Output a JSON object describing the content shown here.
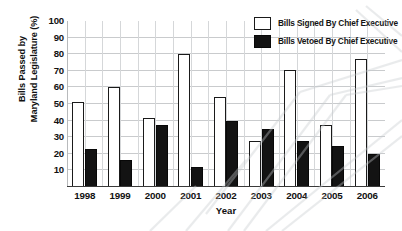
{
  "chart_data": {
    "type": "bar",
    "title": "",
    "xlabel": "Year",
    "ylabel": "Bills Passed by Maryland Legislature (%)",
    "ylabel_line1": "Bills Passed by",
    "ylabel_line2": "Maryland Legislature (%)",
    "categories": [
      "1998",
      "1999",
      "2000",
      "2001",
      "2002",
      "2003",
      "2004",
      "2005",
      "2006"
    ],
    "series": [
      {
        "name": "Bills Signed By Chief Executive",
        "color": "#ffffff",
        "edge_color": "#1a1a1a",
        "values": [
          51,
          60,
          41.5,
          80,
          54,
          28,
          70.5,
          37.5,
          77
        ]
      },
      {
        "name": "Bills Vetoed By Chief Executive",
        "color": "#131313",
        "edge_color": "#080808",
        "values": [
          23,
          16.5,
          37.5,
          12,
          40,
          35,
          28,
          25,
          20
        ]
      }
    ],
    "yticks": [
      10,
      20,
      30,
      40,
      50,
      60,
      70,
      80,
      90,
      100
    ],
    "ytick_labels": [
      "10",
      "20",
      "30",
      "40",
      "50",
      "60",
      "70",
      "80",
      "90",
      "100"
    ],
    "ylim": [
      0,
      100
    ],
    "grid": true,
    "grid_axis": "both",
    "legend_position": "top-right",
    "background_color": "#ffffff"
  },
  "legend": {
    "entries": [
      {
        "label": "Bills Signed By Chief Executive",
        "style": "signed"
      },
      {
        "label": "Bills Vetoed By Chief Executive",
        "style": "vetoed"
      }
    ]
  }
}
